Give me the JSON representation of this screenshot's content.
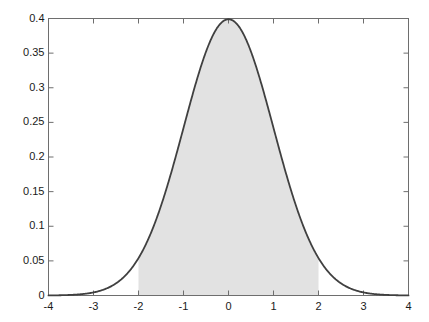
{
  "chart_data": {
    "type": "area",
    "title": "",
    "subtitle": "",
    "xlabel": "",
    "ylabel": "",
    "xlim": [
      -4,
      4
    ],
    "ylim": [
      0,
      0.4
    ],
    "grid": false,
    "legend": null,
    "curve_color": "#404040",
    "fill_color": "#e2e2e2",
    "axis_color": "#6e6e6e",
    "text_color": "#1a1a1a",
    "background_color": "#ffffff",
    "xticks": [
      -4,
      -3,
      -2,
      -1,
      0,
      1,
      2,
      3,
      4
    ],
    "xtick_labels": [
      "-4",
      "-3",
      "-2",
      "-1",
      "0",
      "1",
      "2",
      "3",
      "4"
    ],
    "yticks": [
      0,
      0.05,
      0.1,
      0.15,
      0.2,
      0.25,
      0.3,
      0.35,
      0.4
    ],
    "ytick_labels": [
      "0",
      "0.05",
      "0.1",
      "0.15",
      "0.2",
      "0.25",
      "0.3",
      "0.35",
      "0.4"
    ],
    "series": [
      {
        "name": "standard normal pdf",
        "function": "normal",
        "mean": 0,
        "sd": 1,
        "peak_value": 0.3989,
        "x": [
          -4,
          -3.75,
          -3.5,
          -3.25,
          -3,
          -2.75,
          -2.5,
          -2.25,
          -2,
          -1.75,
          -1.5,
          -1.25,
          -1,
          -0.75,
          -0.5,
          -0.25,
          0,
          0.25,
          0.5,
          0.75,
          1,
          1.25,
          1.5,
          1.75,
          2,
          2.25,
          2.5,
          2.75,
          3,
          3.25,
          3.5,
          3.75,
          4
        ],
        "values": [
          0.0001,
          0.0004,
          0.0009,
          0.002,
          0.0044,
          0.0091,
          0.0175,
          0.0317,
          0.054,
          0.0863,
          0.1295,
          0.1826,
          0.242,
          0.3011,
          0.3521,
          0.3867,
          0.3989,
          0.3867,
          0.3521,
          0.3011,
          0.242,
          0.1826,
          0.1295,
          0.0863,
          0.054,
          0.0317,
          0.0175,
          0.0091,
          0.0044,
          0.002,
          0.0009,
          0.0004,
          0.0001
        ]
      }
    ],
    "shaded_region": {
      "label": "area between -2 and 2",
      "x_start": -2,
      "x_end": 2,
      "fill": "#e2e2e2"
    }
  }
}
